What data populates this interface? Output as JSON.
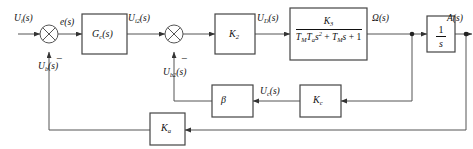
{
  "diagram": {
    "type": "block-diagram",
    "stroke_color": "#333333",
    "text_color": "#111111",
    "background": "#ffffff"
  },
  "signals": {
    "input": "U",
    "input_sub": "i",
    "input_suffix": "(s)",
    "error": "e",
    "error_suffix": "(s)",
    "after_gc": "U",
    "after_gc_sub": "i2",
    "after_gc_suffix": "(s)",
    "after_k2": "U",
    "after_k2_sub": "D",
    "after_k2_suffix": "(s)",
    "speed": "Ω",
    "speed_suffix": "(s)",
    "output": "A",
    "output_suffix": "(s)",
    "feedback_outer": "U",
    "feedback_outer_sub": "b",
    "feedback_outer_suffix": "(s)",
    "feedback_inner": "U",
    "feedback_inner_sub": "b2",
    "feedback_inner_suffix": "(s)",
    "current": "U",
    "current_sub": "c",
    "current_suffix": "(s)"
  },
  "blocks": {
    "controller": {
      "label": "G",
      "sub": "c",
      "suffix": "(s)"
    },
    "amplifier": {
      "label": "K",
      "sub": "2"
    },
    "plant": {
      "numerator": "K",
      "numerator_sub": "3",
      "denominator_a": "T",
      "denominator_a_sub": "M",
      "denominator_b": "T",
      "denominator_b_sub": "a",
      "denominator_s2": "s",
      "denominator_s2_sup": "2",
      "denominator_plus1": "+",
      "denominator_c": "T",
      "denominator_c_sub": "M",
      "denominator_s": "s",
      "denominator_plus2": "+",
      "denominator_one": "1",
      "denominator_full": "TₘTₐs² + Tₘs + 1"
    },
    "integrator": {
      "numerator": "1",
      "denominator": "s"
    },
    "beta": {
      "label": "β"
    },
    "current_gain": {
      "label": "K",
      "sub": "c"
    },
    "outer_feedback_gain": {
      "label": "K",
      "sub": "a"
    }
  },
  "summing_junctions": [
    {
      "name": "sum-1",
      "plus_input": "left",
      "minus_input": "bottom",
      "minus_sign": "−"
    },
    {
      "name": "sum-2",
      "plus_input": "left",
      "minus_input": "bottom",
      "minus_sign": "−"
    }
  ]
}
